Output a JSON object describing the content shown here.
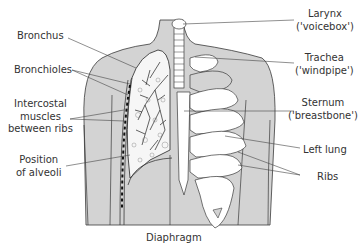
{
  "diagram": {
    "colors": {
      "body_fill": "#d3d3d3",
      "outline": "#3a3a3a",
      "bone_fill": "#ffffff",
      "lung_fill": "#f4f4f4",
      "text": "#333333"
    },
    "labels_left": [
      {
        "id": "bronchus",
        "lines": [
          "Bronchus"
        ]
      },
      {
        "id": "bronchioles",
        "lines": [
          "Bronchioles"
        ]
      },
      {
        "id": "intercostal",
        "lines": [
          "Intercostal",
          "muscles",
          "between ribs"
        ]
      },
      {
        "id": "alveoli",
        "lines": [
          "Position",
          "of alveoli"
        ]
      }
    ],
    "labels_right": [
      {
        "id": "larynx",
        "lines": [
          "Larynx",
          "('voicebox')"
        ]
      },
      {
        "id": "trachea",
        "lines": [
          "Trachea",
          "('windpipe')"
        ]
      },
      {
        "id": "sternum",
        "lines": [
          "Sternum",
          "('breastbone')"
        ]
      },
      {
        "id": "left-lung",
        "lines": [
          "Left lung"
        ]
      },
      {
        "id": "ribs",
        "lines": [
          "Ribs"
        ]
      }
    ],
    "labels_bottom": [
      {
        "id": "diaphragm",
        "lines": [
          "Diaphragm"
        ]
      }
    ]
  }
}
